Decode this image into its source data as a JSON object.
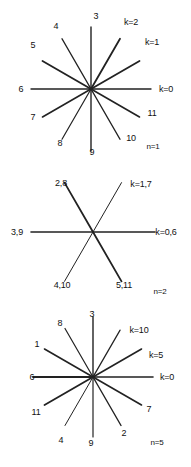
{
  "figure": {
    "type": "diagram",
    "stroke_color": "#222222",
    "background": "#ffffff",
    "panels": [
      {
        "id": "panel-n1",
        "case_label": "n=1",
        "case_label_pos": {
          "x": 153,
          "y": 146
        },
        "center": {
          "x": 91,
          "y": 89
        },
        "spokes": [
          {
            "label": "k=0",
            "angle_deg": 0,
            "length": 60,
            "weight": 1.4,
            "label_pos": {
              "x": 166,
              "y": 89
            }
          },
          {
            "label": "k=1",
            "angle_deg": 30,
            "length": 56,
            "weight": 1.8,
            "label_pos": {
              "x": 152,
              "y": 42
            }
          },
          {
            "label": "k=2",
            "angle_deg": 60,
            "length": 58,
            "weight": 1.8,
            "label_pos": {
              "x": 131,
              "y": 22
            }
          },
          {
            "label": "3",
            "angle_deg": 90,
            "length": 62,
            "weight": 1.4,
            "label_pos": {
              "x": 96,
              "y": 16
            }
          },
          {
            "label": "4",
            "angle_deg": 120,
            "length": 58,
            "weight": 1.4,
            "label_pos": {
              "x": 56,
              "y": 26
            }
          },
          {
            "label": "5",
            "angle_deg": 150,
            "length": 56,
            "weight": 1.8,
            "label_pos": {
              "x": 33,
              "y": 45
            }
          },
          {
            "label": "6",
            "angle_deg": 180,
            "length": 60,
            "weight": 1.4,
            "label_pos": {
              "x": 21,
              "y": 89
            }
          },
          {
            "label": "7",
            "angle_deg": 210,
            "length": 56,
            "weight": 1.6,
            "label_pos": {
              "x": 33,
              "y": 117
            }
          },
          {
            "label": "8",
            "angle_deg": 240,
            "length": 58,
            "weight": 1.2,
            "label_pos": {
              "x": 60,
              "y": 143
            }
          },
          {
            "label": "9",
            "angle_deg": 270,
            "length": 62,
            "weight": 1.4,
            "label_pos": {
              "x": 92,
              "y": 152
            }
          },
          {
            "label": "10",
            "angle_deg": 300,
            "length": 58,
            "weight": 1.4,
            "label_pos": {
              "x": 131,
              "y": 138
            }
          },
          {
            "label": "11",
            "angle_deg": 330,
            "length": 56,
            "weight": 1.6,
            "label_pos": {
              "x": 152,
              "y": 113
            }
          }
        ]
      },
      {
        "id": "panel-n2",
        "case_label": "n=2",
        "case_label_pos": {
          "x": 160,
          "y": 291
        },
        "center": {
          "x": 93,
          "y": 232
        },
        "spokes": [
          {
            "label": "k=0,6",
            "angle_deg": 0,
            "length": 62,
            "weight": 1.6,
            "label_pos": {
              "x": 166,
              "y": 232
            }
          },
          {
            "label": "k=1,7",
            "angle_deg": 60,
            "length": 57,
            "weight": 1.0,
            "label_pos": {
              "x": 141,
              "y": 184
            }
          },
          {
            "label": "2,8",
            "angle_deg": 120,
            "length": 57,
            "weight": 1.8,
            "label_pos": {
              "x": 61,
              "y": 183
            }
          },
          {
            "label": "3,9",
            "angle_deg": 180,
            "length": 62,
            "weight": 1.6,
            "label_pos": {
              "x": 17,
              "y": 232
            }
          },
          {
            "label": "4,10",
            "angle_deg": 240,
            "length": 57,
            "weight": 1.0,
            "label_pos": {
              "x": 62,
              "y": 285
            }
          },
          {
            "label": "5,11",
            "angle_deg": 300,
            "length": 57,
            "weight": 1.8,
            "label_pos": {
              "x": 124,
              "y": 285
            }
          }
        ]
      },
      {
        "id": "panel-n5",
        "case_label": "n=5",
        "case_label_pos": {
          "x": 157,
          "y": 442
        },
        "center": {
          "x": 93,
          "y": 377
        },
        "spokes": [
          {
            "label": "k=0",
            "angle_deg": 0,
            "length": 60,
            "weight": 1.6,
            "label_pos": {
              "x": 167,
              "y": 377
            }
          },
          {
            "label": "k=5",
            "angle_deg": 30,
            "length": 56,
            "weight": 1.6,
            "label_pos": {
              "x": 156,
              "y": 355
            }
          },
          {
            "label": "k=10",
            "angle_deg": 60,
            "length": 54,
            "weight": 1.4,
            "label_pos": {
              "x": 139,
              "y": 330
            }
          },
          {
            "label": "3",
            "angle_deg": 90,
            "length": 60,
            "weight": 1.4,
            "label_pos": {
              "x": 92,
              "y": 314
            }
          },
          {
            "label": "8",
            "angle_deg": 120,
            "length": 56,
            "weight": 1.2,
            "label_pos": {
              "x": 60,
              "y": 323
            }
          },
          {
            "label": "1",
            "angle_deg": 150,
            "length": 56,
            "weight": 1.6,
            "label_pos": {
              "x": 37,
              "y": 344
            }
          },
          {
            "label": "6",
            "angle_deg": 180,
            "length": 60,
            "weight": 1.8,
            "label_pos": {
              "x": 32,
              "y": 377
            }
          },
          {
            "label": "11",
            "angle_deg": 210,
            "length": 56,
            "weight": 1.8,
            "label_pos": {
              "x": 36,
              "y": 412
            }
          },
          {
            "label": "4",
            "angle_deg": 240,
            "length": 56,
            "weight": 1.0,
            "label_pos": {
              "x": 61,
              "y": 440
            }
          },
          {
            "label": "9",
            "angle_deg": 270,
            "length": 60,
            "weight": 1.2,
            "label_pos": {
              "x": 91,
              "y": 443
            }
          },
          {
            "label": "2",
            "angle_deg": 300,
            "length": 56,
            "weight": 1.4,
            "label_pos": {
              "x": 124,
              "y": 433
            }
          },
          {
            "label": "7",
            "angle_deg": 330,
            "length": 56,
            "weight": 1.6,
            "label_pos": {
              "x": 149,
              "y": 409
            }
          }
        ]
      }
    ]
  }
}
